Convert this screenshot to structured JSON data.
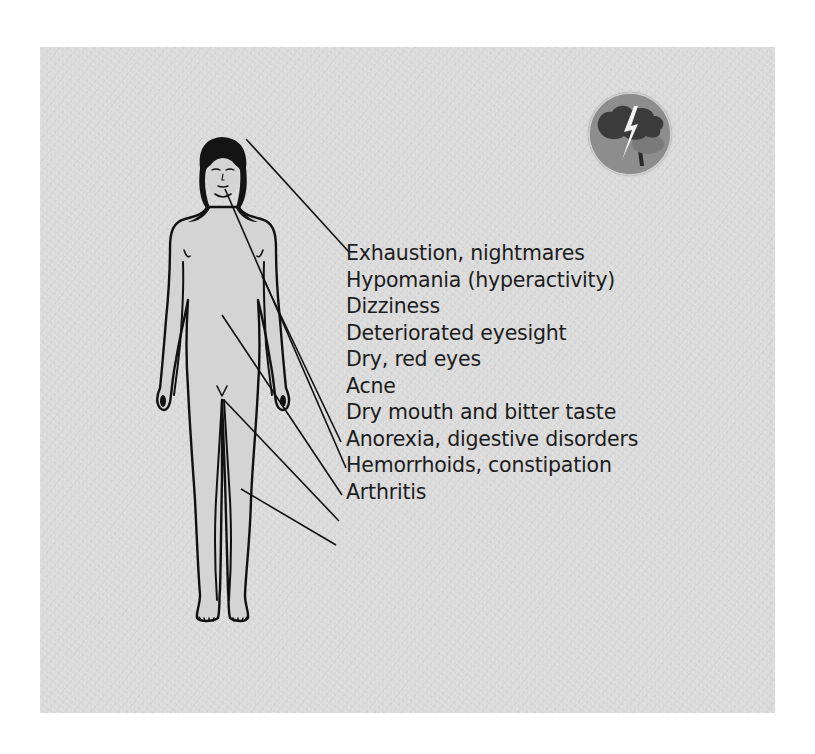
{
  "figure": {
    "background_color": "#d9d9d9",
    "line_color": "#111111"
  },
  "badge": {
    "icon": "storm-cloud-lightning-tree-icon",
    "colors": {
      "circle": "#8c8c8c",
      "cloud": "#3a3a3a",
      "bolt": "#f2f2f2"
    }
  },
  "symptoms": [
    "Exhaustion, nightmares",
    "Hypomania (hyperactivity)",
    "Dizziness",
    "Deteriorated eyesight",
    "Dry, red eyes",
    "Acne",
    "Dry mouth and bitter taste",
    "Anorexia, digestive disorders",
    "Hemorrhoids, constipation",
    "Arthritis"
  ],
  "leader_lines": [
    {
      "from": "head",
      "to_label": "Exhaustion, nightmares"
    },
    {
      "from": "chest",
      "to_label": "Acne"
    },
    {
      "from": "mouth",
      "to_label": "Dry mouth and bitter taste"
    },
    {
      "from": "abdomen",
      "to_label": "Anorexia, digestive disorders"
    },
    {
      "from": "groin",
      "to_label": "Hemorrhoids, constipation"
    },
    {
      "from": "thigh",
      "to_label": "Arthritis"
    }
  ]
}
